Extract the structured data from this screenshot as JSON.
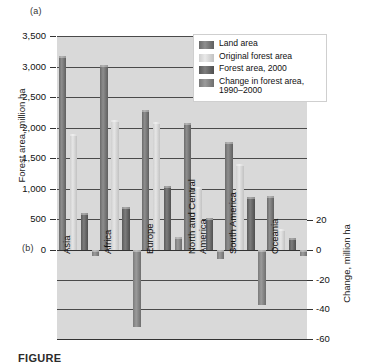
{
  "panels": {
    "a_label": "(a)",
    "b_label": "(b)"
  },
  "caption": "FIGURE",
  "legend": {
    "position": "top-right",
    "items": [
      {
        "label": "Land area",
        "color": "#6b6b6b"
      },
      {
        "label": "Original forest area",
        "color": "#cfcfcf"
      },
      {
        "label": "Forest area, 2000",
        "color": "#5a5a5a"
      },
      {
        "label": "Change in forest area, 1990–2000",
        "color": "#7a7a7a"
      }
    ]
  },
  "chart_data": {
    "type": "bar",
    "title": "",
    "xlabel": "",
    "ylabel": "Forest area, million ha",
    "y2label": "Change, million ha",
    "ylim": [
      0,
      3500
    ],
    "y2lim": [
      -60,
      20
    ],
    "grid": true,
    "categories": [
      "Asia",
      "Africa",
      "Europe",
      "North and Central America",
      "South America",
      "Oceania"
    ],
    "yticks": [
      0,
      500,
      1000,
      1500,
      2000,
      2500,
      3000,
      3500
    ],
    "ytick_labels": [
      "0",
      "500",
      "1,000",
      "1,500",
      "2,000",
      "2,500",
      "3,000",
      "3,500"
    ],
    "y2ticks": [
      20,
      0,
      -20,
      -40,
      -60
    ],
    "y2tick_labels": [
      "20",
      "0",
      "-20",
      "-40",
      "-60"
    ],
    "series": [
      {
        "name": "Land area",
        "axis": "left",
        "values": [
          3180,
          3030,
          2290,
          2070,
          1760,
          880
        ]
      },
      {
        "name": "Original forest area",
        "axis": "left",
        "values": [
          1900,
          2120,
          2100,
          1030,
          1400,
          350
        ]
      },
      {
        "name": "Forest area, 2000",
        "axis": "left",
        "values": [
          610,
          700,
          1040,
          520,
          870,
          200
        ]
      },
      {
        "name": "Change in forest area, 1990–2000",
        "axis": "right",
        "values": [
          -4,
          -52,
          9,
          -6,
          -37,
          -4
        ]
      }
    ]
  }
}
